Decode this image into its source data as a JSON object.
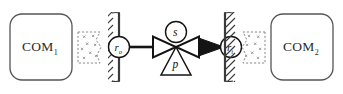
{
  "diagram": {
    "canvas": {
      "width": 343,
      "height": 94,
      "background": "#ffffff"
    },
    "colors": {
      "stroke": "#1a1a1a",
      "box_stroke": "#555555",
      "wall_stroke": "#3a3a3a",
      "dashed_stroke": "#8a8a8a",
      "text": "#2b2b2b",
      "fill_none": "#ffffff"
    },
    "boxes": [
      {
        "id": "com1",
        "base": "COM",
        "subscript": "1"
      },
      {
        "id": "com2",
        "base": "COM",
        "subscript": "2"
      }
    ],
    "ports": [
      {
        "id": "port_out",
        "base": "r",
        "subscript": "o"
      },
      {
        "id": "port_in",
        "base": "r",
        "subscript": "i"
      }
    ],
    "valve": {
      "state_label": "s",
      "param_label": "p",
      "shape": "bowtie",
      "arrow_direction": "right"
    },
    "walls": [
      {
        "id": "wall_left",
        "hatch_side": "left"
      },
      {
        "id": "wall_right",
        "hatch_side": "right"
      }
    ],
    "clouds": [
      {
        "id": "cloud_left"
      },
      {
        "id": "cloud_right"
      }
    ]
  }
}
